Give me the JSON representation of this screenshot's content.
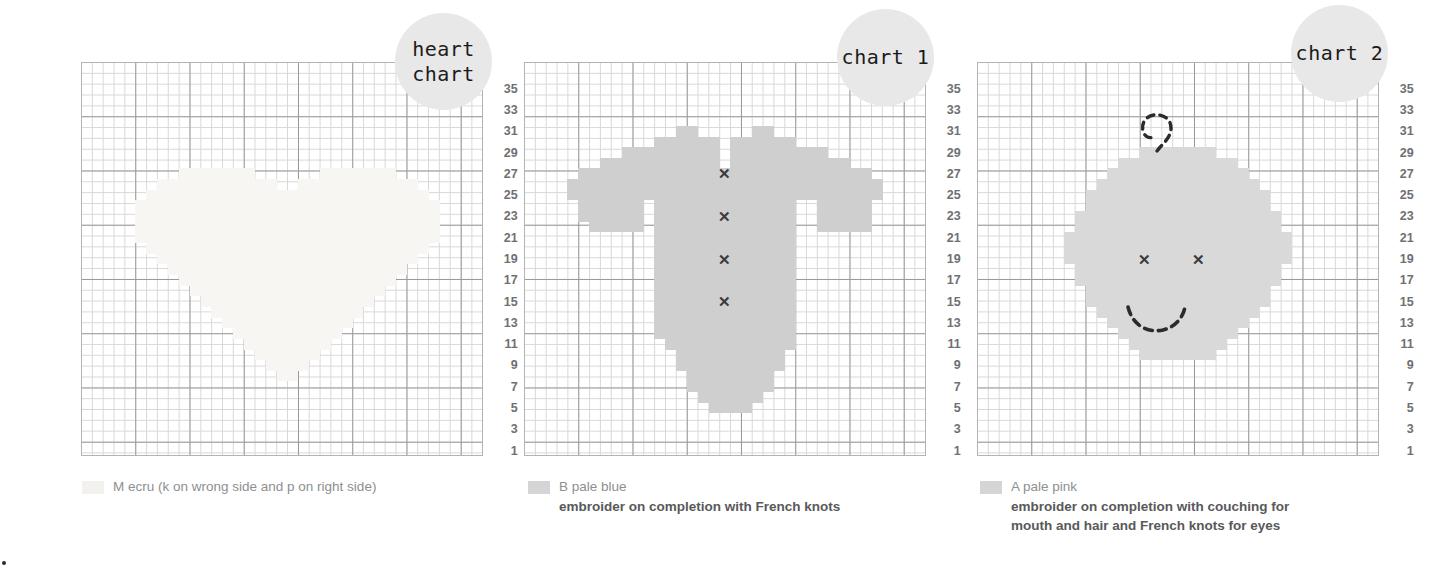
{
  "page": {
    "background": "#ffffff",
    "grid_line_color": "#d8d8d8",
    "grid_bold_color": "#9a9a9a",
    "row_number_color": "#6f7072",
    "badge_color": "#e8e8e8",
    "mark_color": "#3a3a3a"
  },
  "row_numbers": [
    "35",
    "33",
    "31",
    "29",
    "27",
    "25",
    "23",
    "21",
    "19",
    "17",
    "15",
    "13",
    "11",
    "9",
    "7",
    "5",
    "3",
    "1"
  ],
  "charts": [
    {
      "id": "heart-chart",
      "badge_label": "heart\nchart",
      "badge_line1": "heart",
      "badge_line2": "chart",
      "columns": 37,
      "rows": 37,
      "fill_color": "#f7f6f3",
      "legend": {
        "swatch_color": "#f2f1ee",
        "name": "M ecru (k on wrong side and p on right side)",
        "notes": []
      },
      "chart_data": {
        "type": "heatmap",
        "title": "heart chart",
        "motif": "heart",
        "symbol_key": "M ecru (k on wrong side and p on right side)",
        "xlabel": "stitches",
        "ylabel": "rows",
        "grid": true,
        "rows_labelled": [
          "35",
          "33",
          "31",
          "29",
          "27",
          "25",
          "23",
          "21",
          "19",
          "17",
          "15",
          "13",
          "11",
          "9",
          "7",
          "5",
          "3",
          "1"
        ],
        "filled_rows": [
          {
            "row": 27,
            "from": 9,
            "to": 15
          },
          {
            "row": 27,
            "from": 22,
            "to": 28
          },
          {
            "row": 26,
            "from": 7,
            "to": 17
          },
          {
            "row": 26,
            "from": 20,
            "to": 30
          },
          {
            "row": 25,
            "from": 6,
            "to": 31
          },
          {
            "row": 24,
            "from": 5,
            "to": 32
          },
          {
            "row": 23,
            "from": 5,
            "to": 32
          },
          {
            "row": 22,
            "from": 5,
            "to": 32
          },
          {
            "row": 21,
            "from": 5,
            "to": 32
          },
          {
            "row": 20,
            "from": 6,
            "to": 31
          },
          {
            "row": 19,
            "from": 7,
            "to": 30
          },
          {
            "row": 18,
            "from": 8,
            "to": 29
          },
          {
            "row": 17,
            "from": 9,
            "to": 28
          },
          {
            "row": 16,
            "from": 10,
            "to": 27
          },
          {
            "row": 15,
            "from": 11,
            "to": 26
          },
          {
            "row": 14,
            "from": 12,
            "to": 25
          },
          {
            "row": 13,
            "from": 13,
            "to": 24
          },
          {
            "row": 12,
            "from": 14,
            "to": 23
          },
          {
            "row": 11,
            "from": 15,
            "to": 22
          },
          {
            "row": 10,
            "from": 16,
            "to": 21
          },
          {
            "row": 9,
            "from": 17,
            "to": 20
          },
          {
            "row": 8,
            "from": 18,
            "to": 19
          }
        ]
      }
    },
    {
      "id": "chart-1",
      "badge_label": "chart 1",
      "columns": 37,
      "rows": 37,
      "fill_color": "#cfcfcf",
      "legend": {
        "swatch_color": "#d5d5d5",
        "name": "B pale blue",
        "notes": [
          "embroider on completion with French knots"
        ]
      },
      "marks": [
        {
          "type": "cross",
          "col": 18,
          "row": 27
        },
        {
          "type": "cross",
          "col": 18,
          "row": 23
        },
        {
          "type": "cross",
          "col": 18,
          "row": 19
        },
        {
          "type": "cross",
          "col": 18,
          "row": 15
        }
      ],
      "chart_data": {
        "type": "heatmap",
        "title": "chart 1",
        "motif": "sweater / cardigan",
        "symbol_key": "B pale blue",
        "note": "embroider on completion with French knots",
        "xlabel": "stitches",
        "ylabel": "rows",
        "grid": true,
        "french_knot_rows": [
          27,
          23,
          19,
          15
        ],
        "french_knot_column": 18,
        "filled_rows": [
          {
            "row": 31,
            "from": 14,
            "to": 15
          },
          {
            "row": 31,
            "from": 21,
            "to": 22
          },
          {
            "row": 30,
            "from": 12,
            "to": 17
          },
          {
            "row": 30,
            "from": 19,
            "to": 24
          },
          {
            "row": 29,
            "from": 9,
            "to": 17
          },
          {
            "row": 29,
            "from": 19,
            "to": 27
          },
          {
            "row": 28,
            "from": 7,
            "to": 17
          },
          {
            "row": 28,
            "from": 19,
            "to": 29
          },
          {
            "row": 27,
            "from": 5,
            "to": 31
          },
          {
            "row": 26,
            "from": 4,
            "to": 32
          },
          {
            "row": 25,
            "from": 4,
            "to": 32
          },
          {
            "row": 24,
            "from": 5,
            "to": 10
          },
          {
            "row": 24,
            "from": 12,
            "to": 24
          },
          {
            "row": 24,
            "from": 27,
            "to": 31
          },
          {
            "row": 23,
            "from": 5,
            "to": 10
          },
          {
            "row": 23,
            "from": 12,
            "to": 24
          },
          {
            "row": 23,
            "from": 27,
            "to": 31
          },
          {
            "row": 22,
            "from": 6,
            "to": 10
          },
          {
            "row": 22,
            "from": 12,
            "to": 24
          },
          {
            "row": 22,
            "from": 27,
            "to": 31
          },
          {
            "row": 21,
            "from": 12,
            "to": 24
          },
          {
            "row": 20,
            "from": 12,
            "to": 24
          },
          {
            "row": 19,
            "from": 12,
            "to": 24
          },
          {
            "row": 18,
            "from": 12,
            "to": 24
          },
          {
            "row": 17,
            "from": 12,
            "to": 24
          },
          {
            "row": 16,
            "from": 12,
            "to": 24
          },
          {
            "row": 15,
            "from": 12,
            "to": 24
          },
          {
            "row": 14,
            "from": 12,
            "to": 24
          },
          {
            "row": 13,
            "from": 12,
            "to": 24
          },
          {
            "row": 12,
            "from": 12,
            "to": 24
          },
          {
            "row": 11,
            "from": 13,
            "to": 24
          },
          {
            "row": 10,
            "from": 14,
            "to": 23
          },
          {
            "row": 9,
            "from": 14,
            "to": 23
          },
          {
            "row": 8,
            "from": 15,
            "to": 22
          },
          {
            "row": 7,
            "from": 15,
            "to": 22
          },
          {
            "row": 6,
            "from": 16,
            "to": 21
          },
          {
            "row": 5,
            "from": 17,
            "to": 20
          }
        ]
      }
    },
    {
      "id": "chart-2",
      "badge_label": "chart 2",
      "columns": 37,
      "rows": 37,
      "fill_color": "#d9d9d9",
      "legend": {
        "swatch_color": "#d5d5d5",
        "name": "A pale pink",
        "notes": [
          "embroider on completion with couching for",
          "mouth and hair and French knots for eyes"
        ]
      },
      "marks": [
        {
          "type": "cross",
          "col": 15,
          "row": 19
        },
        {
          "type": "cross",
          "col": 20,
          "row": 19
        },
        {
          "type": "mouth",
          "label": "dashed-smile-curve"
        },
        {
          "type": "hair",
          "label": "dashed-hair-curl"
        }
      ],
      "chart_data": {
        "type": "heatmap",
        "title": "chart 2",
        "motif": "face",
        "symbol_key": "A pale pink",
        "note": "embroider on completion with couching for mouth and hair and French knots for eyes",
        "xlabel": "stitches",
        "ylabel": "rows",
        "grid": true,
        "french_knot_eyes": [
          {
            "col": 15,
            "row": 19
          },
          {
            "col": 20,
            "row": 19
          }
        ],
        "filled_rows": [
          {
            "row": 29,
            "from": 15,
            "to": 21
          },
          {
            "row": 28,
            "from": 13,
            "to": 23
          },
          {
            "row": 27,
            "from": 12,
            "to": 24
          },
          {
            "row": 26,
            "from": 11,
            "to": 25
          },
          {
            "row": 25,
            "from": 10,
            "to": 26
          },
          {
            "row": 24,
            "from": 10,
            "to": 26
          },
          {
            "row": 23,
            "from": 9,
            "to": 27
          },
          {
            "row": 22,
            "from": 9,
            "to": 27
          },
          {
            "row": 21,
            "from": 8,
            "to": 28
          },
          {
            "row": 20,
            "from": 8,
            "to": 28
          },
          {
            "row": 19,
            "from": 8,
            "to": 28
          },
          {
            "row": 18,
            "from": 9,
            "to": 27
          },
          {
            "row": 17,
            "from": 9,
            "to": 27
          },
          {
            "row": 16,
            "from": 10,
            "to": 26
          },
          {
            "row": 15,
            "from": 10,
            "to": 26
          },
          {
            "row": 14,
            "from": 11,
            "to": 25
          },
          {
            "row": 13,
            "from": 12,
            "to": 24
          },
          {
            "row": 12,
            "from": 13,
            "to": 23
          },
          {
            "row": 11,
            "from": 14,
            "to": 22
          },
          {
            "row": 10,
            "from": 15,
            "to": 21
          }
        ]
      }
    }
  ]
}
